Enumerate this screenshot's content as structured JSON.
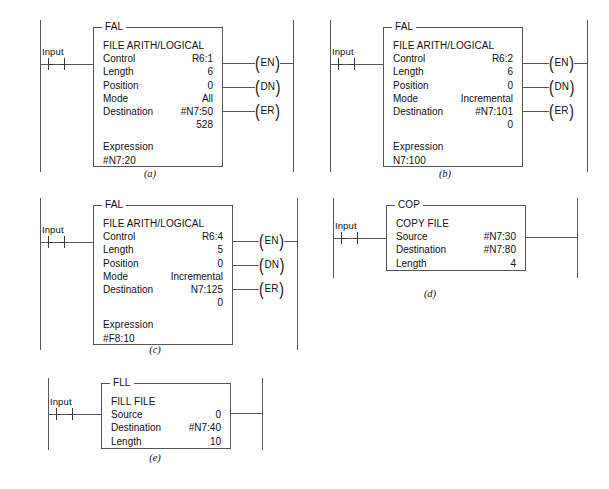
{
  "figure": {
    "diagrams": [
      {
        "id": "a",
        "caption": "(a)",
        "input": {
          "label": "Input",
          "type": "normally-open-contact"
        },
        "block": {
          "legend": "FAL",
          "title": "FILE ARITH/LOGICAL",
          "rows": [
            {
              "key": "Control",
              "value": "R6:1"
            },
            {
              "key": "Length",
              "value": "6"
            },
            {
              "key": "Position",
              "value": "0"
            },
            {
              "key": "Mode",
              "value": "All"
            },
            {
              "key": "Destination",
              "value": "#N7:50"
            }
          ],
          "extra_value": "528",
          "expression_label": "Expression",
          "expression_value": "#N7:20"
        },
        "coils": [
          {
            "name": "EN",
            "connected_to_rail": true
          },
          {
            "name": "DN",
            "connected_to_rail": false
          },
          {
            "name": "ER",
            "connected_to_rail": false
          }
        ]
      },
      {
        "id": "b",
        "caption": "(b)",
        "input": {
          "label": "Input",
          "type": "normally-open-contact"
        },
        "block": {
          "legend": "FAL",
          "title": "FILE ARITH/LOGICAL",
          "rows": [
            {
              "key": "Control",
              "value": "R6:2"
            },
            {
              "key": "Length",
              "value": "6"
            },
            {
              "key": "Position",
              "value": "0"
            },
            {
              "key": "Mode",
              "value": "Incremental"
            },
            {
              "key": "Destination",
              "value": "#N7:101"
            }
          ],
          "extra_value": "0",
          "expression_label": "Expression",
          "expression_value": "N7:100"
        },
        "coils": [
          {
            "name": "EN",
            "connected_to_rail": true
          },
          {
            "name": "DN",
            "connected_to_rail": false
          },
          {
            "name": "ER",
            "connected_to_rail": false
          }
        ]
      },
      {
        "id": "c",
        "caption": "(c)",
        "input": {
          "label": "Input",
          "type": "normally-open-contact"
        },
        "block": {
          "legend": "FAL",
          "title": "FILE ARITH/LOGICAL",
          "rows": [
            {
              "key": "Control",
              "value": "R6:4"
            },
            {
              "key": "Length",
              "value": "5"
            },
            {
              "key": "Position",
              "value": "0"
            },
            {
              "key": "Mode",
              "value": "Incremental"
            },
            {
              "key": "Destination",
              "value": "N7:125"
            }
          ],
          "extra_value": "0",
          "expression_label": "Expression",
          "expression_value": "#F8:10"
        },
        "coils": [
          {
            "name": "EN",
            "connected_to_rail": true
          },
          {
            "name": "DN",
            "connected_to_rail": false
          },
          {
            "name": "ER",
            "connected_to_rail": false
          }
        ]
      },
      {
        "id": "d",
        "caption": "(d)",
        "input": {
          "label": "Input",
          "type": "normally-open-contact"
        },
        "block": {
          "legend": "COP",
          "title": "COPY FILE",
          "rows": [
            {
              "key": "Source",
              "value": "#N7:30"
            },
            {
              "key": "Destination",
              "value": "#N7:80"
            },
            {
              "key": "Length",
              "value": "4"
            }
          ]
        },
        "coils": []
      },
      {
        "id": "e",
        "caption": "(e)",
        "input": {
          "label": "Input",
          "type": "normally-open-contact"
        },
        "block": {
          "legend": "FLL",
          "title": "FILL FILE",
          "rows": [
            {
              "key": "Source",
              "value": "0"
            },
            {
              "key": "Destination",
              "value": "#N7:40"
            },
            {
              "key": "Length",
              "value": "10"
            }
          ]
        },
        "coils": []
      }
    ]
  }
}
